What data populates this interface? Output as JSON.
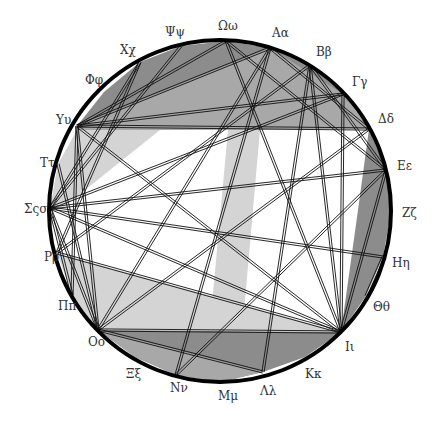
{
  "diagram": {
    "type": "greek-alphabet-circle-chord-diagram",
    "circle": {
      "cx": 220,
      "cy": 211,
      "r": 171,
      "stroke": "#000000",
      "stroke_width": 4
    },
    "colors": {
      "dark": "#8c8c8c",
      "medium": "#a8a8a8",
      "light": "#d4d4d4",
      "line": "#111111",
      "label": "#333333"
    },
    "letters": [
      {
        "id": "omega",
        "label": "Ωω",
        "x": 226,
        "y": 41,
        "lx": 218,
        "ly": 30
      },
      {
        "id": "alpha",
        "label": "Aα",
        "x": 270,
        "y": 48,
        "lx": 272,
        "ly": 37
      },
      {
        "id": "beta",
        "label": "Bβ",
        "x": 310,
        "y": 65,
        "lx": 316,
        "ly": 56
      },
      {
        "id": "gamma",
        "label": "Γγ",
        "x": 343,
        "y": 94,
        "lx": 352,
        "ly": 86
      },
      {
        "id": "delta",
        "label": "Δδ",
        "x": 369,
        "y": 129,
        "lx": 378,
        "ly": 123
      },
      {
        "id": "epsilon",
        "label": "Eε",
        "x": 386,
        "y": 170,
        "lx": 397,
        "ly": 170
      },
      {
        "id": "zeta",
        "label": "Zζ",
        "x": 391,
        "y": 213,
        "lx": 402,
        "ly": 217
      },
      {
        "id": "eta",
        "label": "Hη",
        "x": 383,
        "y": 257,
        "lx": 392,
        "ly": 267
      },
      {
        "id": "theta",
        "label": "Θθ",
        "x": 366,
        "y": 296,
        "lx": 373,
        "ly": 311
      },
      {
        "id": "iota",
        "label": "Iι",
        "x": 341,
        "y": 332,
        "lx": 345,
        "ly": 351
      },
      {
        "id": "kappa",
        "label": "Kκ",
        "x": 305,
        "y": 357,
        "lx": 305,
        "ly": 378
      },
      {
        "id": "lambda",
        "label": "Λλ",
        "x": 263,
        "y": 372,
        "lx": 260,
        "ly": 395
      },
      {
        "id": "mu",
        "label": "Mμ",
        "x": 220,
        "y": 382,
        "lx": 218,
        "ly": 400
      },
      {
        "id": "nu",
        "label": "Nν",
        "x": 176,
        "y": 375,
        "lx": 170,
        "ly": 392
      },
      {
        "id": "xi",
        "label": "Ξξ",
        "x": 135,
        "y": 357,
        "lx": 126,
        "ly": 378
      },
      {
        "id": "omicron",
        "label": "Oo",
        "x": 98,
        "y": 330,
        "lx": 88,
        "ly": 346
      },
      {
        "id": "pi",
        "label": "Ππ",
        "x": 72,
        "y": 295,
        "lx": 58,
        "ly": 310
      },
      {
        "id": "rho",
        "label": "Pρ",
        "x": 57,
        "y": 253,
        "lx": 44,
        "ly": 261
      },
      {
        "id": "sigma",
        "label": "Σςσ",
        "x": 50,
        "y": 208,
        "lx": 24,
        "ly": 213
      },
      {
        "id": "tau",
        "label": "Tτ",
        "x": 58,
        "y": 164,
        "lx": 40,
        "ly": 167
      },
      {
        "id": "upsilon",
        "label": "Yυ",
        "x": 77,
        "y": 126,
        "lx": 56,
        "ly": 124
      },
      {
        "id": "phi",
        "label": "Φφ",
        "x": 104,
        "y": 92,
        "lx": 85,
        "ly": 84
      },
      {
        "id": "chi",
        "label": "Xχ",
        "x": 140,
        "y": 62,
        "lx": 120,
        "ly": 54
      },
      {
        "id": "psi",
        "label": "Ψψ",
        "x": 181,
        "y": 46,
        "lx": 165,
        "ly": 36
      }
    ],
    "regions": [
      {
        "name": "top-dark-cap",
        "shade": "dark",
        "points": "77,126 104,92 140,62 181,46 226,41 270,48 310,65 343,94 369,129 77,130"
      },
      {
        "name": "top-medium-band",
        "shade": "medium",
        "points": "77,126 270,48 343,94 369,129 77,130"
      },
      {
        "name": "upper-left-light",
        "shade": "light",
        "points": "77,130 160,130 60,210 50,208 58,164"
      },
      {
        "name": "vertical-band",
        "shade": "light",
        "points": "228,130 260,130 238,380 205,380"
      },
      {
        "name": "right-dark-lens",
        "shade": "dark",
        "points": "369,129 386,170 391,213 383,257 366,296 341,332 358,210"
      },
      {
        "name": "lower-left-light",
        "shade": "light",
        "points": "57,253 341,332 98,330 72,295"
      },
      {
        "name": "bottom-dark-cap",
        "shade": "dark",
        "points": "98,330 341,332 305,357 263,372 220,382 176,375 135,357"
      },
      {
        "name": "bottom-medium-wedge",
        "shade": "medium",
        "points": "98,330 263,372 220,382 176,375 135,357"
      }
    ],
    "chords": [
      [
        "upsilon",
        "alpha"
      ],
      [
        "upsilon",
        "delta"
      ],
      [
        "upsilon",
        "iota"
      ],
      [
        "upsilon",
        "omicron"
      ],
      [
        "upsilon",
        "gamma"
      ],
      [
        "chi",
        "sigma"
      ],
      [
        "chi",
        "rho"
      ],
      [
        "psi",
        "sigma"
      ],
      [
        "omega",
        "upsilon"
      ],
      [
        "omega",
        "iota"
      ],
      [
        "omega",
        "epsilon"
      ],
      [
        "alpha",
        "nu"
      ],
      [
        "alpha",
        "omicron"
      ],
      [
        "alpha",
        "delta"
      ],
      [
        "beta",
        "rho"
      ],
      [
        "beta",
        "iota"
      ],
      [
        "beta",
        "lambda"
      ],
      [
        "beta",
        "epsilon"
      ],
      [
        "gamma",
        "sigma"
      ],
      [
        "gamma",
        "iota"
      ],
      [
        "delta",
        "omicron"
      ],
      [
        "epsilon",
        "sigma"
      ],
      [
        "epsilon",
        "nu"
      ],
      [
        "epsilon",
        "iota"
      ],
      [
        "eta",
        "sigma"
      ],
      [
        "eta",
        "theta"
      ],
      [
        "iota",
        "sigma"
      ],
      [
        "iota",
        "rho"
      ],
      [
        "iota",
        "omicron"
      ],
      [
        "omicron",
        "lambda"
      ],
      [
        "sigma",
        "omicron"
      ],
      [
        "tau",
        "omicron"
      ],
      [
        "sigma",
        "pi"
      ],
      [
        "upsilon",
        "pi"
      ]
    ]
  }
}
